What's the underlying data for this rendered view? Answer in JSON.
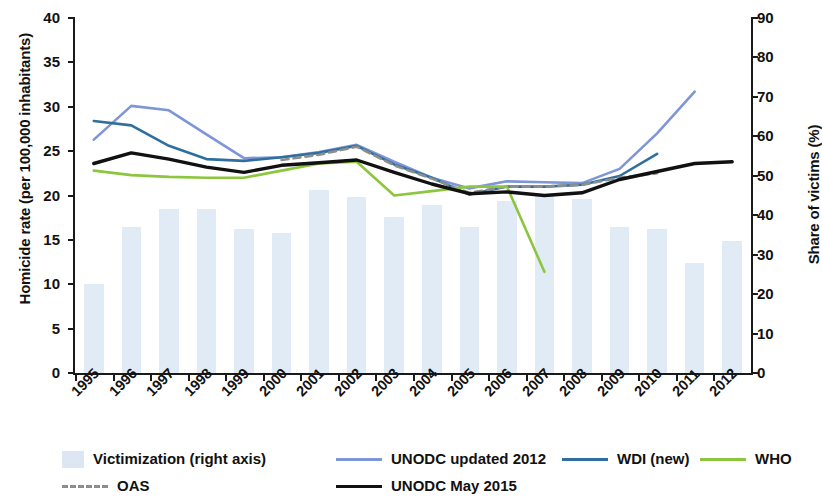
{
  "chart_data": {
    "type": "line",
    "title": "",
    "xlabel": "",
    "ylabel": "Homicide rate (per 100,000 inhabitants)",
    "y2label": "Share of victims (%)",
    "categories": [
      "1995",
      "1996",
      "1997",
      "1998",
      "1999",
      "2000",
      "2001",
      "2002",
      "2003",
      "2004",
      "2005",
      "2006",
      "2007",
      "2008",
      "2009",
      "2010",
      "2011",
      "2012"
    ],
    "ylim": [
      0,
      40
    ],
    "yticks": [
      40,
      35,
      30,
      25,
      20,
      15,
      10,
      5,
      0
    ],
    "y2lim": [
      0,
      90
    ],
    "y2ticks": [
      90,
      80,
      70,
      60,
      50,
      40,
      30,
      20,
      10,
      0
    ],
    "grid": false,
    "legend_position": "bottom",
    "series": [
      {
        "name": "Victimization (right axis)",
        "type": "bar",
        "axis": "right",
        "color": "#dce7f3",
        "values": [
          22.5,
          37.0,
          41.5,
          41.5,
          36.5,
          35.5,
          46.5,
          44.5,
          39.5,
          42.5,
          37.0,
          43.5,
          45.0,
          44.0,
          37.0,
          36.5,
          28.0,
          33.5
        ]
      },
      {
        "name": "UNODC updated 2012",
        "type": "line",
        "axis": "left",
        "color": "#7e96d8",
        "values": [
          26.3,
          30.1,
          29.6,
          26.9,
          24.2,
          24.3,
          24.9,
          25.7,
          23.8,
          22.0,
          20.8,
          21.6,
          21.5,
          21.4,
          23.0,
          27.0,
          31.7,
          null
        ]
      },
      {
        "name": "WDI (new)",
        "type": "line",
        "axis": "left",
        "color": "#2f6f9e",
        "values": [
          28.4,
          27.9,
          25.6,
          24.1,
          23.9,
          24.3,
          24.8,
          25.6,
          23.5,
          22.0,
          20.1,
          21.0,
          21.0,
          21.2,
          22.2,
          24.7,
          null,
          null
        ]
      },
      {
        "name": "UNODC May 2015",
        "type": "line",
        "axis": "left",
        "color": "#111111",
        "values": [
          23.6,
          24.8,
          24.1,
          23.2,
          22.6,
          23.4,
          23.7,
          24.0,
          22.6,
          21.3,
          20.2,
          20.4,
          20.0,
          20.3,
          21.8,
          22.7,
          23.6,
          23.8
        ]
      },
      {
        "name": "WHO",
        "type": "line",
        "axis": "left",
        "color": "#8cc63e",
        "values": [
          22.8,
          22.3,
          22.1,
          22.0,
          22.0,
          22.8,
          23.6,
          23.8,
          20.0,
          20.5,
          21.0,
          21.0,
          11.4,
          null,
          null,
          null,
          null,
          null
        ]
      },
      {
        "name": "OAS",
        "type": "line-dashed",
        "axis": "left",
        "color": "#8a8f8c",
        "values": [
          null,
          null,
          null,
          null,
          null,
          24.0,
          24.6,
          25.5,
          23.4,
          21.9,
          20.3,
          21.0,
          21.0,
          21.2,
          22.0,
          22.5,
          null,
          null
        ]
      }
    ]
  },
  "axes": {
    "left_title": "Homicide rate (per 100,000 inhabitants)",
    "right_title": "Share of victims (%)",
    "left_ticks": [
      "40",
      "35",
      "30",
      "25",
      "20",
      "15",
      "10",
      "5",
      "0"
    ],
    "right_ticks": [
      "90",
      "80",
      "70",
      "60",
      "50",
      "40",
      "30",
      "20",
      "10",
      "0"
    ],
    "x_ticks": [
      "1995",
      "1996",
      "1997",
      "1998",
      "1999",
      "2000",
      "2001",
      "2002",
      "2003",
      "2004",
      "2005",
      "2006",
      "2007",
      "2008",
      "2009",
      "2010",
      "2011",
      "2012"
    ]
  },
  "legend": {
    "items": [
      {
        "label": "Victimization (right axis)",
        "marker": "bar-swatch",
        "color": "#dce7f3"
      },
      {
        "label": "UNODC updated 2012",
        "marker": "line-swatch",
        "color": "#7e96d8"
      },
      {
        "label": "WDI (new)",
        "marker": "line-swatch",
        "color": "#2f6f9e"
      },
      {
        "label": "WHO",
        "marker": "line-swatch",
        "color": "#8cc63e"
      },
      {
        "label": "OAS",
        "marker": "dashed-line-swatch",
        "color": "#8a8f8c"
      },
      {
        "label": "UNODC May 2015",
        "marker": "line-swatch",
        "color": "#111111"
      }
    ]
  }
}
